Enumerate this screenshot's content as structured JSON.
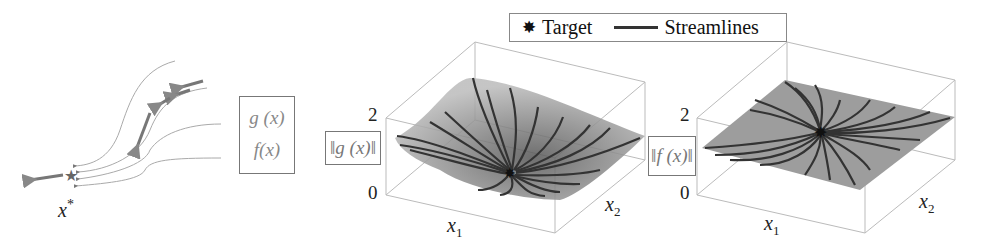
{
  "legend": {
    "target_label": "Target",
    "target_symbol": "✸",
    "streamlines_label": "Streamlines"
  },
  "sketch": {
    "target_label": "x",
    "target_superscript": "*",
    "function_box": [
      "g (x)",
      "f(x)"
    ]
  },
  "plot_g": {
    "zlabel": "‖g (x)‖",
    "zticks": [
      "0",
      "2"
    ],
    "xlabel": "x",
    "xlabel_sub": "1",
    "ylabel": "x",
    "ylabel_sub": "2"
  },
  "plot_f": {
    "zlabel": "‖f (x)‖",
    "zticks": [
      "0",
      "2"
    ],
    "xlabel": "x",
    "xlabel_sub": "1",
    "ylabel": "x",
    "ylabel_sub": "2"
  },
  "colors": {
    "surface": "#9a9a9a",
    "streamline": "#333333",
    "axis_box": "#bbbbbb",
    "sketch_line": "#999999",
    "sketch_arrow": "#777777"
  }
}
